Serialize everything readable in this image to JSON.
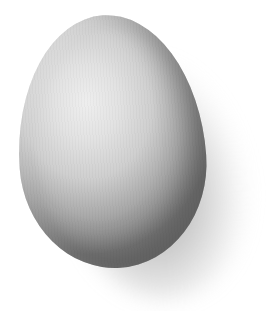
{
  "image": {
    "subject": "egg",
    "description": "Single white/grey egg on white background with soft shadow to the lower right",
    "colors": {
      "background": "#ffffff",
      "egg_highlight": "#eeeeee",
      "egg_midtone": "#cfcfcf",
      "egg_shadow": "#7c7c7c",
      "cast_shadow": "#5a5a5a"
    }
  }
}
